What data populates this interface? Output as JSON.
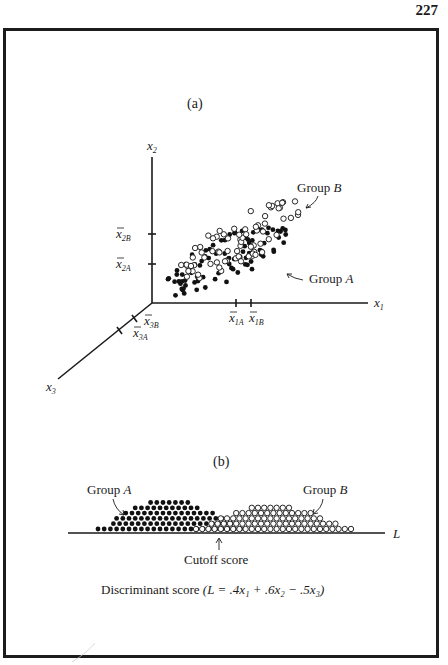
{
  "page": {
    "number": "227"
  },
  "figure": {
    "panel_a": {
      "label": "(a)",
      "axes": {
        "x1": {
          "name": "x",
          "sub": "1"
        },
        "x2": {
          "name": "x",
          "sub": "2"
        },
        "x3": {
          "name": "x",
          "sub": "3"
        }
      },
      "means": {
        "x1A": {
          "name": "x",
          "sub": "1A"
        },
        "x1B": {
          "name": "x",
          "sub": "1B"
        },
        "x2A": {
          "name": "x",
          "sub": "2A"
        },
        "x2B": {
          "name": "x",
          "sub": "2B"
        },
        "x3A": {
          "name": "x",
          "sub": "3A"
        },
        "x3B": {
          "name": "x",
          "sub": "3B"
        }
      },
      "group_a_label": {
        "word": "Group",
        "letter": "A"
      },
      "group_b_label": {
        "word": "Group",
        "letter": "B"
      }
    },
    "panel_b": {
      "label": "(b)",
      "axis_label": "L",
      "group_a_label": {
        "word": "Group",
        "letter": "A"
      },
      "group_b_label": {
        "word": "Group",
        "letter": "B"
      },
      "cutoff_label": "Cutoff score",
      "caption_prefix": "Discriminant score",
      "formula": "(L = .4x₁ + .6x₂ − .5x₃)"
    }
  },
  "chart_data": [
    {
      "type": "scatter",
      "title": "(a) Two groups in three-dimensional variable space",
      "axes": [
        "x1",
        "x2",
        "x3"
      ],
      "series": [
        {
          "name": "Group A",
          "marker": "filled circle",
          "mean_ticks": [
            "x̄1A",
            "x̄2A",
            "x̄3A"
          ]
        },
        {
          "name": "Group B",
          "marker": "open circle",
          "mean_ticks": [
            "x̄1B",
            "x̄2B",
            "x̄3B"
          ]
        }
      ],
      "notes": "Group B mean is higher on x1 and x2 and lower on x3 than Group A; clouds overlap"
    },
    {
      "type": "scatter",
      "title": "(b) Projection onto discriminant score axis L",
      "xlabel": "Discriminant score (L = .4x1 + .6x2 - .5x3)",
      "series": [
        {
          "name": "Group A",
          "marker": "filled circle",
          "distribution": "mound on left"
        },
        {
          "name": "Group B",
          "marker": "open circle",
          "distribution": "mound on right"
        }
      ],
      "annotations": [
        "Cutoff score (arrow at boundary between groups)"
      ],
      "coefficients": {
        "x1": 0.4,
        "x2": 0.6,
        "x3": -0.5
      }
    }
  ]
}
